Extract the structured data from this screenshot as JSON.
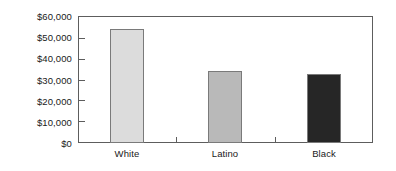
{
  "chart_data": {
    "type": "bar",
    "title": "",
    "subtitle": "",
    "xlabel": "",
    "ylabel": "",
    "categories": [
      "White",
      "Latino",
      "Black"
    ],
    "values": [
      53800,
      33800,
      32400
    ],
    "series": [
      {
        "name": "Median household income",
        "values": [
          53800,
          33800,
          32400
        ]
      }
    ],
    "ylim": [
      0,
      60000
    ],
    "y_ticks": [
      0,
      10000,
      20000,
      30000,
      40000,
      50000,
      60000
    ],
    "y_tick_labels": [
      "$0",
      "$10,000",
      "$20,000",
      "$30,000",
      "$40,000",
      "$50,000",
      "$60,000"
    ],
    "grid": false,
    "legend": false,
    "legend_position": "none",
    "bar_colors": [
      "#dcdcdc",
      "#b9b9b9",
      "#262626"
    ],
    "bar_border_color": "#7a7a7a",
    "frame_color": "#5d5d5d",
    "background_color": "#ffffff",
    "text_color": "#1a1a1a"
  }
}
